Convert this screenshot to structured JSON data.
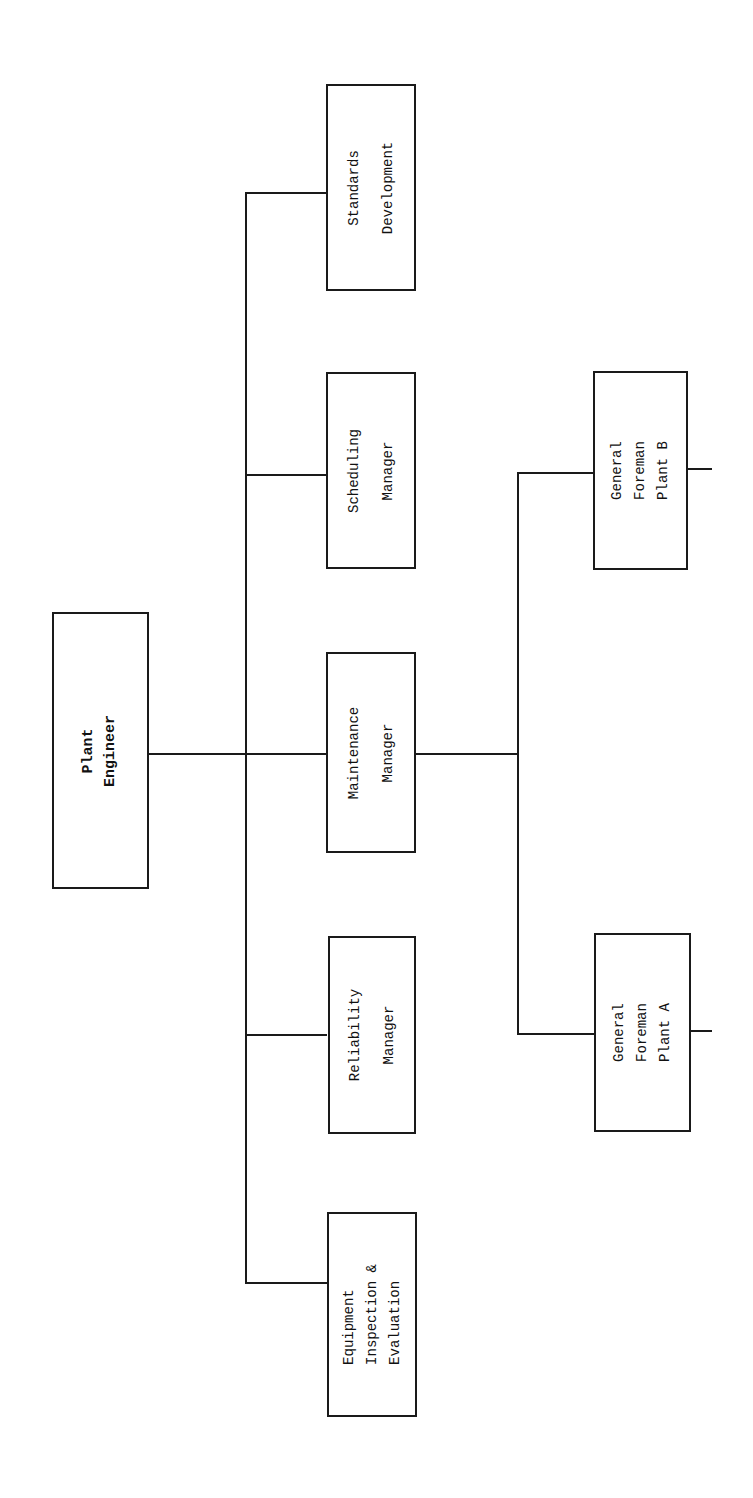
{
  "chart": {
    "root": {
      "id": "plant-engineer",
      "label": "Plant\nEngineer"
    },
    "level1": [
      {
        "id": "standards-development",
        "label": "Standards\nDevelopment"
      },
      {
        "id": "scheduling-manager",
        "label": "Scheduling\nManager"
      },
      {
        "id": "maintenance-manager",
        "label": "Maintenance\nManager"
      },
      {
        "id": "reliability-manager",
        "label": "Reliability\nManager"
      },
      {
        "id": "equipment-inspection-evaluation",
        "label": "Equipment\nInspection &\nEvaluation"
      }
    ],
    "level2": [
      {
        "id": "general-foreman-plant-b",
        "parent": "maintenance-manager",
        "label": "General\nForeman\nPlant B"
      },
      {
        "id": "general-foreman-plant-a",
        "parent": "maintenance-manager",
        "label": "General\nForeman\nPlant A"
      }
    ]
  },
  "colors": {
    "line": "#1a1a1a",
    "background": "#ffffff"
  }
}
